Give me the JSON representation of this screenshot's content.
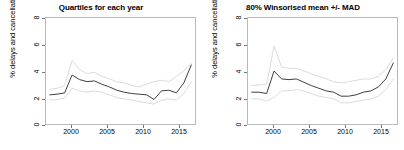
{
  "figure": {
    "width": 404,
    "height": 150,
    "background": "#ffffff",
    "line_color": "#3b3b3b",
    "band_color": "#d6d6d6",
    "axis_color": "#b9b9b9"
  },
  "chart_data": [
    {
      "type": "line",
      "title": "Quartiles for each year",
      "xlabel": "",
      "ylabel": "% delays and cancellations",
      "xlim": [
        1996.5,
        2016.5
      ],
      "ylim": [
        0,
        8
      ],
      "xticks": [
        2000,
        2005,
        2010,
        2015
      ],
      "yticks": [
        0,
        2,
        4,
        6,
        8
      ],
      "grid": false,
      "legend": "none",
      "x": [
        1997,
        1998,
        1999,
        2000,
        2001,
        2002,
        2003,
        2004,
        2005,
        2006,
        2007,
        2008,
        2009,
        2010,
        2011,
        2012,
        2013,
        2014,
        2015,
        2016
      ],
      "series": [
        {
          "name": "Upper quartile",
          "style": "light",
          "values": [
            2.6,
            2.7,
            2.9,
            4.8,
            4.1,
            3.8,
            3.9,
            3.6,
            3.4,
            3.2,
            3.1,
            2.9,
            2.8,
            3.0,
            3.2,
            3.3,
            3.2,
            3.6,
            4.0,
            4.6
          ]
        },
        {
          "name": "Median",
          "style": "dark",
          "values": [
            2.2,
            2.25,
            2.35,
            3.7,
            3.35,
            3.2,
            3.25,
            3.0,
            2.8,
            2.55,
            2.4,
            2.3,
            2.25,
            2.2,
            1.85,
            2.5,
            2.55,
            2.35,
            3.1,
            4.45
          ]
        },
        {
          "name": "Lower quartile",
          "style": "light",
          "values": [
            1.8,
            1.85,
            1.95,
            2.7,
            2.5,
            2.4,
            2.5,
            2.4,
            2.2,
            2.0,
            1.9,
            1.8,
            1.7,
            1.6,
            1.5,
            1.8,
            1.9,
            1.8,
            2.3,
            3.2
          ]
        }
      ]
    },
    {
      "type": "line",
      "title": "80% Winsorised mean +/- MAD",
      "xlabel": "",
      "ylabel": "% delays and cancellations",
      "xlim": [
        1996.5,
        2016.5
      ],
      "ylim": [
        0,
        8
      ],
      "xticks": [
        2000,
        2005,
        2010,
        2015
      ],
      "yticks": [
        0,
        2,
        4,
        6,
        8
      ],
      "grid": false,
      "legend": "none",
      "x": [
        1997,
        1998,
        1999,
        2000,
        2001,
        2002,
        2003,
        2004,
        2005,
        2006,
        2007,
        2008,
        2009,
        2010,
        2011,
        2012,
        2013,
        2014,
        2015,
        2016
      ],
      "series": [
        {
          "name": "Mean + MAD",
          "style": "light",
          "values": [
            2.9,
            2.95,
            3.0,
            5.9,
            4.3,
            4.2,
            4.2,
            4.0,
            3.8,
            3.6,
            3.4,
            3.2,
            3.1,
            3.2,
            3.3,
            3.4,
            3.4,
            3.6,
            4.1,
            5.0
          ]
        },
        {
          "name": "Winsorised mean",
          "style": "dark",
          "values": [
            2.4,
            2.4,
            2.3,
            4.0,
            3.4,
            3.35,
            3.4,
            3.15,
            2.9,
            2.7,
            2.5,
            2.4,
            2.1,
            2.1,
            2.2,
            2.4,
            2.5,
            2.8,
            3.4,
            4.6
          ]
        },
        {
          "name": "Mean - MAD",
          "style": "light",
          "values": [
            1.9,
            1.9,
            1.75,
            2.0,
            2.5,
            2.5,
            2.6,
            2.5,
            2.3,
            2.1,
            2.0,
            1.9,
            1.6,
            1.6,
            1.7,
            1.8,
            1.9,
            2.1,
            2.6,
            3.4
          ]
        }
      ]
    }
  ],
  "panels": [
    {
      "id": "quartiles",
      "title": "Quartiles for each year",
      "ylabel": "% delays and cancellations",
      "yticks": [
        "0",
        "2",
        "4",
        "6",
        "8"
      ],
      "xticks": [
        "2000",
        "2005",
        "2010",
        "2015"
      ]
    },
    {
      "id": "winsorised",
      "title": "80% Winsorised mean +/- MAD",
      "ylabel": "% delays and cancellations",
      "yticks": [
        "0",
        "2",
        "4",
        "6",
        "8"
      ],
      "xticks": [
        "2000",
        "2005",
        "2010",
        "2015"
      ]
    }
  ]
}
